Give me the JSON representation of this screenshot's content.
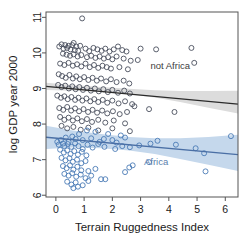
{
  "chart_data": {
    "type": "scatter",
    "title": "",
    "xlabel": "Terrain Ruggedness Index",
    "ylabel": "log GDP year 2000",
    "xlim": [
      -0.35,
      6.45
    ],
    "ylim": [
      5.95,
      11.15
    ],
    "xticks": [
      0,
      1,
      2,
      3,
      4,
      5,
      6
    ],
    "yticks": [
      6,
      7,
      8,
      9,
      10,
      11
    ],
    "grid": false,
    "legend_position": "in-plot-annotations",
    "annotations": [
      {
        "text": "not Africa",
        "x": 4.05,
        "y": 9.55,
        "color": "#3d3d3d"
      },
      {
        "text": "Africa",
        "x": 3.55,
        "y": 6.85,
        "color": "#5b7fae"
      }
    ],
    "series": [
      {
        "name": "not Africa",
        "marker": "open-circle",
        "color": "#4a4f5e",
        "fit_line": {
          "x0": -0.35,
          "y0": 9.06,
          "x1": 6.45,
          "y1": 8.56,
          "color": "#2b2b2b"
        },
        "ci_band": {
          "color": "#dcdcdc",
          "upper": [
            9.16,
            9.1,
            9.04,
            8.99,
            8.95,
            8.93,
            8.93,
            8.94
          ],
          "lower": [
            8.96,
            8.94,
            8.9,
            8.84,
            8.75,
            8.62,
            8.46,
            8.3
          ],
          "x": [
            -0.35,
            0.6,
            1.6,
            2.6,
            3.5,
            4.4,
            5.4,
            6.45
          ]
        },
        "points": [
          [
            0.93,
            10.97
          ],
          [
            0.63,
            10.28
          ],
          [
            0.2,
            10.24
          ],
          [
            0.33,
            10.22
          ],
          [
            0.45,
            10.2
          ],
          [
            0.58,
            10.22
          ],
          [
            0.72,
            10.18
          ],
          [
            0.86,
            10.2
          ],
          [
            1.05,
            10.12
          ],
          [
            0.12,
            10.18
          ],
          [
            0.27,
            10.12
          ],
          [
            0.4,
            10.14
          ],
          [
            0.52,
            10.1
          ],
          [
            0.67,
            10.08
          ],
          [
            0.79,
            10.06
          ],
          [
            1.18,
            10.05
          ],
          [
            1.33,
            10.14
          ],
          [
            1.47,
            10.1
          ],
          [
            1.62,
            10.06
          ],
          [
            1.75,
            10.12
          ],
          [
            1.9,
            10.04
          ],
          [
            2.05,
            10.1
          ],
          [
            2.2,
            10.18
          ],
          [
            2.35,
            10.08
          ],
          [
            2.5,
            10.04
          ],
          [
            3.0,
            10.12
          ],
          [
            3.55,
            10.1
          ],
          [
            4.8,
            10.14
          ],
          [
            0.25,
            9.98
          ],
          [
            0.38,
            9.95
          ],
          [
            0.5,
            9.92
          ],
          [
            0.63,
            9.96
          ],
          [
            0.77,
            9.9
          ],
          [
            0.9,
            9.94
          ],
          [
            1.1,
            9.88
          ],
          [
            1.25,
            9.92
          ],
          [
            1.4,
            9.86
          ],
          [
            1.55,
            9.9
          ],
          [
            1.7,
            9.84
          ],
          [
            1.85,
            9.88
          ],
          [
            2.0,
            9.82
          ],
          [
            2.15,
            9.9
          ],
          [
            2.4,
            9.84
          ],
          [
            2.65,
            9.78
          ],
          [
            2.9,
            9.8
          ],
          [
            4.9,
            9.72
          ],
          [
            0.15,
            9.7
          ],
          [
            0.3,
            9.66
          ],
          [
            0.45,
            9.72
          ],
          [
            0.6,
            9.64
          ],
          [
            0.75,
            9.68
          ],
          [
            0.9,
            9.62
          ],
          [
            1.05,
            9.7
          ],
          [
            1.2,
            9.6
          ],
          [
            1.35,
            9.66
          ],
          [
            1.5,
            9.58
          ],
          [
            1.65,
            9.64
          ],
          [
            1.8,
            9.6
          ],
          [
            1.95,
            9.56
          ],
          [
            2.25,
            9.6
          ],
          [
            2.55,
            9.54
          ],
          [
            0.1,
            9.4
          ],
          [
            0.22,
            9.35
          ],
          [
            0.35,
            9.3
          ],
          [
            0.48,
            9.38
          ],
          [
            0.6,
            9.28
          ],
          [
            0.72,
            9.34
          ],
          [
            0.85,
            9.26
          ],
          [
            1.0,
            9.32
          ],
          [
            1.15,
            9.24
          ],
          [
            1.3,
            9.3
          ],
          [
            1.45,
            9.22
          ],
          [
            1.6,
            9.28
          ],
          [
            1.78,
            9.2
          ],
          [
            1.95,
            9.26
          ],
          [
            2.15,
            9.18
          ],
          [
            2.4,
            9.22
          ],
          [
            2.6,
            9.14
          ],
          [
            0.08,
            9.1
          ],
          [
            0.2,
            9.04
          ],
          [
            0.33,
            9.08
          ],
          [
            0.46,
            9.0
          ],
          [
            0.58,
            9.06
          ],
          [
            0.7,
            8.98
          ],
          [
            0.83,
            9.04
          ],
          [
            0.96,
            8.96
          ],
          [
            1.1,
            9.02
          ],
          [
            1.24,
            8.94
          ],
          [
            1.38,
            9.0
          ],
          [
            1.52,
            8.92
          ],
          [
            1.68,
            8.98
          ],
          [
            1.84,
            8.9
          ],
          [
            2.0,
            8.96
          ],
          [
            2.2,
            8.88
          ],
          [
            2.42,
            8.94
          ],
          [
            2.62,
            8.86
          ],
          [
            0.05,
            8.8
          ],
          [
            0.18,
            8.74
          ],
          [
            0.3,
            8.78
          ],
          [
            0.42,
            8.7
          ],
          [
            0.55,
            8.76
          ],
          [
            0.68,
            8.68
          ],
          [
            0.8,
            8.74
          ],
          [
            0.94,
            8.66
          ],
          [
            1.08,
            8.72
          ],
          [
            1.22,
            8.64
          ],
          [
            1.36,
            8.7
          ],
          [
            1.5,
            8.62
          ],
          [
            1.66,
            8.68
          ],
          [
            1.82,
            8.6
          ],
          [
            2.0,
            8.66
          ],
          [
            2.22,
            8.58
          ],
          [
            2.45,
            8.64
          ],
          [
            2.7,
            8.56
          ],
          [
            0.12,
            8.45
          ],
          [
            0.26,
            8.4
          ],
          [
            0.4,
            8.48
          ],
          [
            0.54,
            8.38
          ],
          [
            0.68,
            8.44
          ],
          [
            0.82,
            8.36
          ],
          [
            0.98,
            8.42
          ],
          [
            1.14,
            8.34
          ],
          [
            1.3,
            8.4
          ],
          [
            1.46,
            8.32
          ],
          [
            1.64,
            8.38
          ],
          [
            1.82,
            8.3
          ],
          [
            2.02,
            8.36
          ],
          [
            2.26,
            8.28
          ],
          [
            2.52,
            8.34
          ],
          [
            2.78,
            8.5
          ],
          [
            3.3,
            8.42
          ],
          [
            4.2,
            8.34
          ],
          [
            0.15,
            8.2
          ],
          [
            0.3,
            8.12
          ],
          [
            0.45,
            8.18
          ],
          [
            0.6,
            8.1
          ],
          [
            0.76,
            8.16
          ],
          [
            0.92,
            8.08
          ],
          [
            1.1,
            8.14
          ],
          [
            1.28,
            8.06
          ],
          [
            1.5,
            8.12
          ],
          [
            1.75,
            8.04
          ],
          [
            2.05,
            8.1
          ],
          [
            2.45,
            8.02
          ],
          [
            0.2,
            7.95
          ],
          [
            0.4,
            7.88
          ],
          [
            0.62,
            7.92
          ],
          [
            0.88,
            7.84
          ],
          [
            1.15,
            7.9
          ],
          [
            1.5,
            7.82
          ],
          [
            2.0,
            7.88
          ],
          [
            2.62,
            7.8
          ]
        ]
      },
      {
        "name": "Africa",
        "marker": "open-circle",
        "color": "#4a7ab5",
        "fit_line": {
          "x0": -0.35,
          "y0": 7.63,
          "x1": 6.45,
          "y1": 7.14,
          "color": "#4a6fa5"
        },
        "ci_band": {
          "color": "#c5d8ec",
          "upper": [
            7.95,
            7.82,
            7.72,
            7.64,
            7.6,
            7.6,
            7.64,
            7.7
          ],
          "lower": [
            7.3,
            7.34,
            7.32,
            7.26,
            7.16,
            7.02,
            6.86,
            6.68
          ],
          "x": [
            -0.35,
            0.6,
            1.6,
            2.6,
            3.5,
            4.4,
            5.4,
            6.45
          ]
        },
        "points": [
          [
            6.2,
            7.66
          ],
          [
            3.6,
            7.53
          ],
          [
            3.35,
            7.45
          ],
          [
            2.95,
            7.4
          ],
          [
            2.62,
            7.35
          ],
          [
            2.45,
            7.62
          ],
          [
            2.3,
            7.68
          ],
          [
            2.15,
            7.48
          ],
          [
            2.0,
            7.55
          ],
          [
            1.85,
            7.72
          ],
          [
            1.7,
            7.58
          ],
          [
            1.55,
            7.5
          ],
          [
            1.4,
            7.78
          ],
          [
            1.25,
            7.6
          ],
          [
            1.1,
            7.82
          ],
          [
            0.95,
            7.55
          ],
          [
            0.82,
            7.72
          ],
          [
            0.7,
            7.58
          ],
          [
            0.58,
            7.65
          ],
          [
            0.45,
            7.5
          ],
          [
            0.35,
            7.62
          ],
          [
            0.25,
            7.45
          ],
          [
            0.18,
            7.55
          ],
          [
            0.1,
            7.42
          ],
          [
            0.05,
            7.5
          ],
          [
            0.3,
            7.38
          ],
          [
            0.42,
            7.44
          ],
          [
            0.55,
            7.36
          ],
          [
            0.68,
            7.46
          ],
          [
            0.8,
            7.38
          ],
          [
            0.95,
            7.3
          ],
          [
            1.12,
            7.42
          ],
          [
            1.3,
            7.34
          ],
          [
            1.5,
            7.44
          ],
          [
            1.72,
            7.36
          ],
          [
            2.1,
            7.3
          ],
          [
            2.35,
            7.38
          ],
          [
            4.25,
            7.42
          ],
          [
            4.95,
            7.32
          ],
          [
            5.25,
            7.18
          ],
          [
            0.15,
            7.28
          ],
          [
            0.28,
            7.2
          ],
          [
            0.4,
            7.26
          ],
          [
            0.52,
            7.16
          ],
          [
            0.65,
            7.24
          ],
          [
            0.78,
            7.14
          ],
          [
            0.92,
            7.22
          ],
          [
            1.08,
            7.12
          ],
          [
            0.2,
            7.05
          ],
          [
            0.34,
            6.98
          ],
          [
            0.48,
            7.04
          ],
          [
            0.6,
            6.94
          ],
          [
            0.75,
            7.0
          ],
          [
            0.9,
            6.9
          ],
          [
            1.05,
            6.96
          ],
          [
            0.25,
            6.82
          ],
          [
            0.38,
            6.76
          ],
          [
            0.5,
            6.84
          ],
          [
            0.62,
            6.72
          ],
          [
            0.76,
            6.8
          ],
          [
            0.9,
            6.7
          ],
          [
            1.15,
            6.68
          ],
          [
            1.4,
            6.74
          ],
          [
            3.3,
            6.93
          ],
          [
            2.45,
            6.65
          ],
          [
            2.6,
            6.78
          ],
          [
            2.72,
            6.84
          ],
          [
            5.3,
            6.67
          ],
          [
            0.3,
            6.6
          ],
          [
            0.45,
            6.55
          ],
          [
            0.58,
            6.62
          ],
          [
            0.72,
            6.52
          ],
          [
            0.88,
            6.58
          ],
          [
            1.05,
            6.48
          ],
          [
            1.25,
            6.55
          ],
          [
            1.6,
            6.45
          ],
          [
            1.75,
            6.45
          ],
          [
            0.4,
            6.38
          ],
          [
            0.55,
            6.3
          ],
          [
            0.7,
            6.36
          ],
          [
            0.95,
            6.28
          ],
          [
            0.62,
            6.2
          ],
          [
            0.78,
            6.24
          ],
          [
            1.15,
            6.4
          ]
        ]
      }
    ]
  },
  "axis": {
    "x_tick_labels": [
      "0",
      "1",
      "2",
      "3",
      "4",
      "5",
      "6"
    ],
    "y_tick_labels": [
      "6",
      "7",
      "8",
      "9",
      "10",
      "11"
    ]
  }
}
